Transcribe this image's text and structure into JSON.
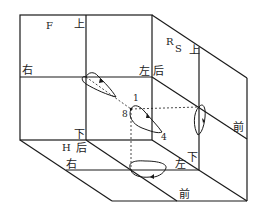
{
  "diagram": {
    "type": "three-plane projection (unfolded cube) of a closed spatial curve",
    "planes": {
      "front": {
        "label": "F",
        "directions": {
          "top": "上",
          "left": "右",
          "bottom": "下"
        }
      },
      "side": {
        "label_r": "R",
        "label_s": "S",
        "directions": {
          "top": "上",
          "left_top": "左",
          "left_back": "后",
          "bottom": "下",
          "front": "前"
        }
      },
      "horizontal": {
        "label": "H",
        "directions": {
          "back": "后",
          "right": "右",
          "left": "左",
          "front": "前"
        }
      }
    },
    "point_labels": {
      "p1": "1",
      "p4": "4",
      "p8": "8"
    },
    "colors": {
      "line": "#1a1a1a",
      "background": "#ffffff"
    }
  },
  "labels": {
    "F": "F",
    "front_top": "上",
    "front_right": "右",
    "side_R": "R",
    "side_S": "S",
    "side_top": "上",
    "side_left": "左",
    "side_back": "后",
    "side_front": "前",
    "front_bottom": "下",
    "H": "H",
    "h_back": "后",
    "h_right": "右",
    "h_left": "左",
    "side_bottom": "下",
    "h_front": "前",
    "pt1": "1",
    "pt4": "4",
    "pt8": "8"
  }
}
